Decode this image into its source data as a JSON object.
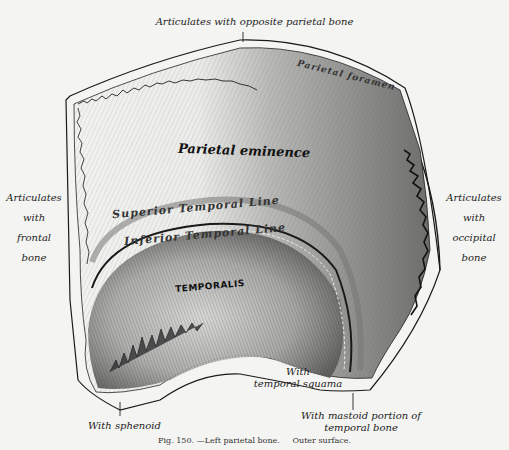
{
  "figure": {
    "caption_num": "Fig. 150.",
    "caption_title": "—Left parietal bone.",
    "caption_sub": "Outer surface.",
    "colors": {
      "paper": "#f4f4f2",
      "ink": "#1a1a1a",
      "shade_dark": "#3a3a3a",
      "shade_mid": "#8a8a8a",
      "shade_light": "#c8c8c8"
    }
  },
  "borders": {
    "top": "Articulates with opposite parietal bone",
    "left": [
      "Articulates",
      "with",
      "frontal",
      "bone"
    ],
    "right": [
      "Articulates",
      "with",
      "occipital",
      "bone"
    ],
    "squama": [
      "With",
      "temporal squama"
    ],
    "sphenoid": "With sphenoid",
    "mastoid": [
      "With mastoid portion of",
      "temporal bone"
    ]
  },
  "surface_labels": {
    "parietal_foramen": "Parietal foramen",
    "parietal_eminence": "Parietal eminence",
    "superior_temporal_line": "Superior Temporal Line",
    "inferior_temporal_line": "Inferior Temporal Line",
    "temporalis": "TEMPORALIS"
  }
}
